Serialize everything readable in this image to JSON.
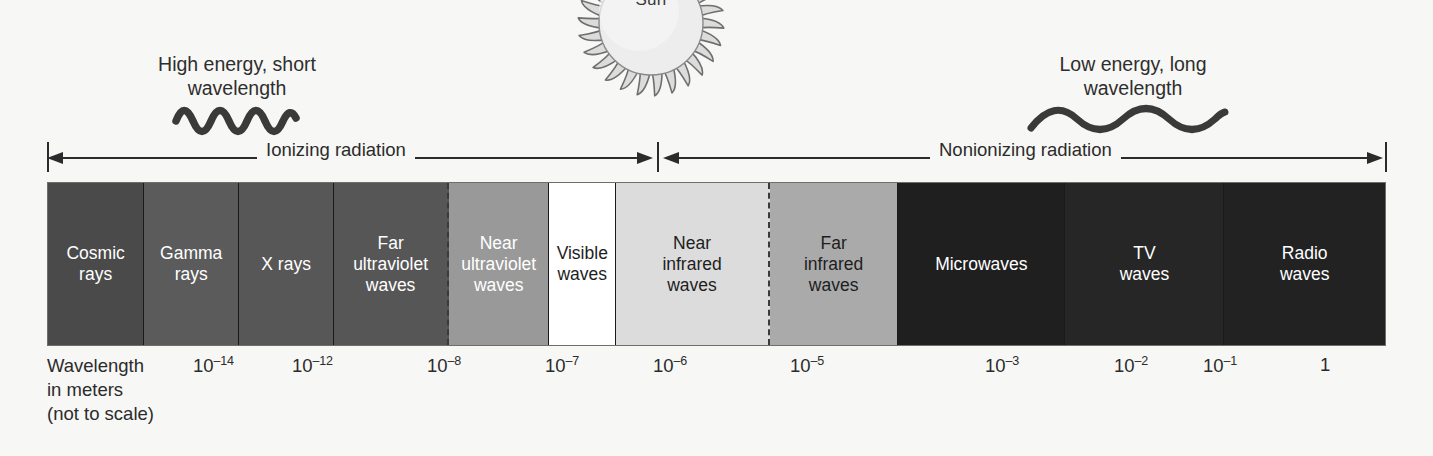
{
  "sun": {
    "label": "Sun"
  },
  "notes": {
    "left": {
      "text": "High energy, short\nwavelength",
      "wave": "short-wavelength-squiggle"
    },
    "right": {
      "text": "Low energy, long\nwavelength",
      "wave": "long-wavelength-squiggle"
    }
  },
  "radiation_ranges": [
    {
      "label": "Ionizing radiation",
      "start_pct": 0.0,
      "end_pct": 45.6
    },
    {
      "label": "Nonionizing radiation",
      "start_pct": 45.6,
      "end_pct": 100.0
    }
  ],
  "chart_data": {
    "type": "bar",
    "xlabel": "Wavelength\nin meters\n(not to scale)",
    "grid": false,
    "legend": "none",
    "categories": [
      "Cosmic rays",
      "Gamma rays",
      "X rays",
      "Far ultraviolet waves",
      "Near ultraviolet waves",
      "Visible waves",
      "Near infrared waves",
      "Far infrared waves",
      "Microwaves",
      "TV waves",
      "Radio waves"
    ],
    "bands": [
      {
        "label": "Cosmic\nrays",
        "width_pct": 7.2,
        "fill": "#4a4a4a",
        "text": "#ffffff",
        "divider": "solid"
      },
      {
        "label": "Gamma\nrays",
        "width_pct": 7.1,
        "fill": "#5b5b5b",
        "text": "#ffffff",
        "divider": "solid"
      },
      {
        "label": "X rays",
        "width_pct": 7.1,
        "fill": "#575757",
        "text": "#ffffff",
        "divider": "solid"
      },
      {
        "label": "Far\nultraviolet\nwaves",
        "width_pct": 8.6,
        "fill": "#565656",
        "text": "#ffffff",
        "divider": "dashed"
      },
      {
        "label": "Near\nultraviolet\nwaves",
        "width_pct": 7.5,
        "fill": "#999999",
        "text": "#ffffff",
        "divider": "solid"
      },
      {
        "label": "Visible\nwaves",
        "width_pct": 5.0,
        "fill": "#ffffff",
        "text": "#1e1e1e",
        "divider": "solid"
      },
      {
        "label": "Near\ninfrared\nwaves",
        "width_pct": 11.5,
        "fill": "#dcdcdc",
        "text": "#1e1e1e",
        "divider": "dashed"
      },
      {
        "label": "Far\ninfrared\nwaves",
        "width_pct": 9.6,
        "fill": "#aaaaaa",
        "text": "#1e1e1e",
        "divider": "solid"
      },
      {
        "label": "Microwaves",
        "width_pct": 12.5,
        "fill": "#1f1f1f",
        "text": "#ffffff",
        "divider": "solid"
      },
      {
        "label": "TV\nwaves",
        "width_pct": 11.9,
        "fill": "#262626",
        "text": "#ffffff",
        "divider": "solid"
      },
      {
        "label": "Radio\nwaves",
        "width_pct": 12.0,
        "fill": "#222222",
        "text": "#ffffff",
        "divider": "none"
      }
    ],
    "axis_caption": "Wavelength\nin meters\n(not to scale)",
    "ticks": [
      {
        "mantissa": "10",
        "exponent": "–14",
        "display": "10⁻¹⁴",
        "x": 193
      },
      {
        "mantissa": "10",
        "exponent": "–12",
        "display": "10⁻¹²",
        "x": 292
      },
      {
        "mantissa": "10",
        "exponent": "–8",
        "display": "10⁻⁸",
        "x": 427
      },
      {
        "mantissa": "10",
        "exponent": "–7",
        "display": "10⁻⁷",
        "x": 545
      },
      {
        "mantissa": "10",
        "exponent": "–6",
        "display": "10⁻⁶",
        "x": 653
      },
      {
        "mantissa": "10",
        "exponent": "–5",
        "display": "10⁻⁵",
        "x": 790
      },
      {
        "mantissa": "10",
        "exponent": "–3",
        "display": "10⁻³",
        "x": 985
      },
      {
        "mantissa": "10",
        "exponent": "–2",
        "display": "10⁻²",
        "x": 1114
      },
      {
        "mantissa": "10",
        "exponent": "–1",
        "display": "10⁻¹",
        "x": 1203
      },
      {
        "mantissa": "1",
        "exponent": "",
        "display": "1",
        "x": 1320
      }
    ]
  },
  "colors": {
    "background": "#f7f7f5",
    "ink": "#2b2b2b",
    "bar_border": "#6e6e6e",
    "sun_body": "#e9e9e9",
    "sun_ray": "#8f8f8f"
  }
}
